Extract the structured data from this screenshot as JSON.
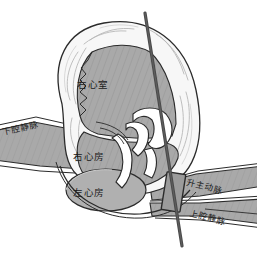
{
  "figure": {
    "background_color": "#ffffff"
  },
  "labels": {
    "right_ventricle": "右心室",
    "right_atrium": "右心房",
    "left_atrium": "左心房",
    "inferior_vena_cava": "下腔静脉",
    "ascending_aorta": "升主动脉",
    "superior_vena_cava": "上腔静脉"
  },
  "colors": {
    "chamber_fill": "#a9a9a9",
    "vessel_fill": "#a9a9a9",
    "myocardium_fill": "#f7f7f7",
    "outline": "#2b2b2b",
    "guidewire": "#4a4a4a",
    "device_fill": "#9b9b9b",
    "device_border": "#2b2b2b",
    "label_text": "#1a1a1a",
    "background": "#ffffff"
  },
  "devices": {
    "guidewire_name": "guidewire-line",
    "implant_name": "rectangular-implant-device"
  }
}
